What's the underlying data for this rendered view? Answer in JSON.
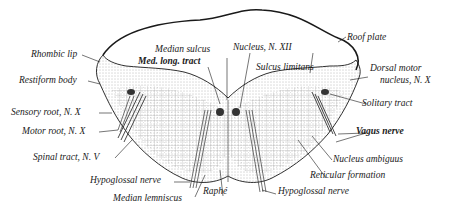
{
  "figure": {
    "colors": {
      "ink": "#1a1a1a",
      "background": "#ffffff",
      "stipple": "#6b6b6b"
    }
  },
  "labels": {
    "rhombic_lip": "Rhombic lip",
    "restiform_body": "Restiform body",
    "sensory_root": "Sensory root, N. X",
    "motor_root": "Motor root, N. X",
    "spinal_tract": "Spinal tract, N. V",
    "hypoglossal_nerve_left": "Hypoglossal nerve",
    "median_lemniscus": "Median lemniscus",
    "raphe": "Raphé",
    "median_sulcus": "Median sulcus",
    "med_long_tract": "Med. long. tract",
    "nucleus_xii": "Nucleus, N. XII",
    "sulcus_limitans": "Sulcus limitans",
    "roof_plate": "Roof plate",
    "dorsal_motor_nucleus_1": "Dorsal motor",
    "dorsal_motor_nucleus_2": "nucleus, N. X",
    "solitary_tract": "Solitary tract",
    "vagus_nerve": "Vagus nerve",
    "nucleus_ambiguus": "Nucleus ambiguus",
    "reticular_formation": "Reticular formation",
    "hypoglossal_nerve_right": "Hypoglossal nerve"
  }
}
